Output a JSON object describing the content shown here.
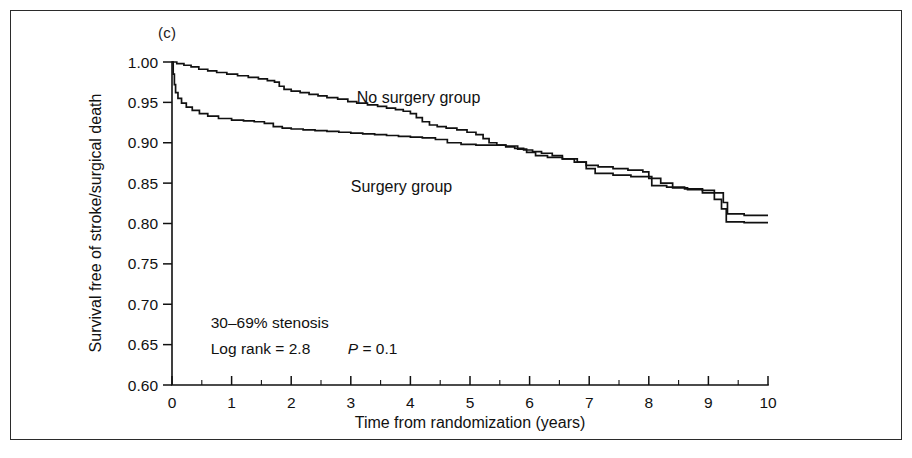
{
  "figure": {
    "panel_label": "(c)"
  },
  "chart_data": {
    "type": "line",
    "title": "",
    "subtitle": "",
    "xlabel": "Time from randomization (years)",
    "ylabel": "Survival free of stroke/surgical death",
    "xlim": [
      0,
      10
    ],
    "ylim": [
      0.6,
      1.0
    ],
    "grid": false,
    "legend_position": "inline-labels",
    "xticks": [
      0,
      1,
      2,
      3,
      4,
      5,
      6,
      7,
      8,
      9,
      10
    ],
    "xtick_labels": [
      "0",
      "1",
      "2",
      "3",
      "4",
      "5",
      "6",
      "7",
      "8",
      "9",
      "10"
    ],
    "xminor_step": 0.5,
    "yticks": [
      0.6,
      0.65,
      0.7,
      0.75,
      0.8,
      0.85,
      0.9,
      0.95,
      1.0
    ],
    "ytick_labels": [
      "0.60",
      "0.65",
      "0.70",
      "0.75",
      "0.80",
      "0.85",
      "0.90",
      "0.95",
      "1.00"
    ],
    "annotations": [
      {
        "name": "stenosis-note",
        "text": "30–69% stenosis",
        "x": 0.65,
        "y": 0.677
      },
      {
        "name": "logrank-note",
        "text": "Log rank = 2.8",
        "x": 0.65,
        "y": 0.645
      },
      {
        "name": "pvalue-note",
        "text": "P = 0.1",
        "x": 2.95,
        "y": 0.645,
        "italic_lead": "P"
      }
    ],
    "series": [
      {
        "name": "No surgery group",
        "color": "#111111",
        "label_x": 3.1,
        "label_y": 0.955,
        "step": "post",
        "points": [
          [
            0.0,
            1.0
          ],
          [
            0.08,
            0.998
          ],
          [
            0.2,
            0.996
          ],
          [
            0.32,
            0.994
          ],
          [
            0.45,
            0.991
          ],
          [
            0.6,
            0.989
          ],
          [
            0.75,
            0.987
          ],
          [
            0.92,
            0.985
          ],
          [
            1.1,
            0.983
          ],
          [
            1.28,
            0.981
          ],
          [
            1.45,
            0.979
          ],
          [
            1.6,
            0.977
          ],
          [
            1.72,
            0.975
          ],
          [
            1.8,
            0.97
          ],
          [
            1.88,
            0.966
          ],
          [
            2.0,
            0.964
          ],
          [
            2.15,
            0.962
          ],
          [
            2.3,
            0.96
          ],
          [
            2.45,
            0.958
          ],
          [
            2.6,
            0.956
          ],
          [
            2.78,
            0.954
          ],
          [
            2.95,
            0.951
          ],
          [
            3.1,
            0.949
          ],
          [
            3.28,
            0.947
          ],
          [
            3.45,
            0.945
          ],
          [
            3.6,
            0.943
          ],
          [
            3.75,
            0.941
          ],
          [
            3.88,
            0.939
          ],
          [
            4.0,
            0.936
          ],
          [
            4.1,
            0.931
          ],
          [
            4.2,
            0.926
          ],
          [
            4.32,
            0.922
          ],
          [
            4.45,
            0.92
          ],
          [
            4.6,
            0.918
          ],
          [
            4.78,
            0.916
          ],
          [
            4.95,
            0.913
          ],
          [
            5.1,
            0.91
          ],
          [
            5.22,
            0.905
          ],
          [
            5.32,
            0.9
          ],
          [
            5.45,
            0.897
          ],
          [
            5.6,
            0.895
          ],
          [
            5.75,
            0.893
          ],
          [
            5.9,
            0.891
          ],
          [
            6.05,
            0.889
          ],
          [
            6.2,
            0.887
          ],
          [
            6.38,
            0.884
          ],
          [
            6.55,
            0.88
          ],
          [
            6.75,
            0.876
          ],
          [
            6.95,
            0.872
          ],
          [
            7.15,
            0.87
          ],
          [
            7.4,
            0.868
          ],
          [
            7.65,
            0.866
          ],
          [
            7.9,
            0.864
          ],
          [
            8.0,
            0.858
          ],
          [
            8.05,
            0.847
          ],
          [
            8.3,
            0.845
          ],
          [
            8.6,
            0.843
          ],
          [
            8.9,
            0.841
          ],
          [
            9.1,
            0.838
          ],
          [
            9.25,
            0.826
          ],
          [
            9.32,
            0.812
          ],
          [
            9.6,
            0.81
          ],
          [
            10.0,
            0.81
          ]
        ]
      },
      {
        "name": "Surgery group",
        "color": "#111111",
        "label_x": 3.0,
        "label_y": 0.845,
        "step": "post",
        "points": [
          [
            0.0,
            1.0
          ],
          [
            0.02,
            0.985
          ],
          [
            0.04,
            0.972
          ],
          [
            0.06,
            0.962
          ],
          [
            0.1,
            0.955
          ],
          [
            0.16,
            0.949
          ],
          [
            0.24,
            0.944
          ],
          [
            0.34,
            0.94
          ],
          [
            0.46,
            0.936
          ],
          [
            0.6,
            0.933
          ],
          [
            0.78,
            0.93
          ],
          [
            1.0,
            0.928
          ],
          [
            1.2,
            0.927
          ],
          [
            1.38,
            0.926
          ],
          [
            1.55,
            0.924
          ],
          [
            1.7,
            0.92
          ],
          [
            1.85,
            0.918
          ],
          [
            2.0,
            0.917
          ],
          [
            2.2,
            0.916
          ],
          [
            2.4,
            0.915
          ],
          [
            2.6,
            0.914
          ],
          [
            2.8,
            0.913
          ],
          [
            3.0,
            0.912
          ],
          [
            3.2,
            0.911
          ],
          [
            3.4,
            0.91
          ],
          [
            3.6,
            0.909
          ],
          [
            3.8,
            0.908
          ],
          [
            4.0,
            0.907
          ],
          [
            4.2,
            0.906
          ],
          [
            4.42,
            0.904
          ],
          [
            4.62,
            0.9
          ],
          [
            4.85,
            0.898
          ],
          [
            5.1,
            0.897
          ],
          [
            5.35,
            0.897
          ],
          [
            5.6,
            0.896
          ],
          [
            5.8,
            0.892
          ],
          [
            5.95,
            0.888
          ],
          [
            6.1,
            0.884
          ],
          [
            6.3,
            0.882
          ],
          [
            6.55,
            0.88
          ],
          [
            6.8,
            0.876
          ],
          [
            6.95,
            0.868
          ],
          [
            7.1,
            0.862
          ],
          [
            7.4,
            0.86
          ],
          [
            7.7,
            0.858
          ],
          [
            8.0,
            0.856
          ],
          [
            8.2,
            0.85
          ],
          [
            8.4,
            0.844
          ],
          [
            8.65,
            0.842
          ],
          [
            8.9,
            0.838
          ],
          [
            9.1,
            0.83
          ],
          [
            9.22,
            0.818
          ],
          [
            9.3,
            0.802
          ],
          [
            9.6,
            0.801
          ],
          [
            10.0,
            0.801
          ]
        ]
      }
    ]
  }
}
